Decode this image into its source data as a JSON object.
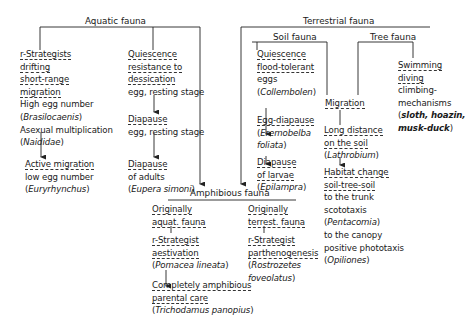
{
  "headers": {
    "aquatic": "Aquatic fauna",
    "terrestrial": "Terrestrial fauna",
    "soil": "Soil fauna",
    "tree": "Tree fauna",
    "amphibious": "Amphibious fauna"
  },
  "aquatic": {
    "r_strategists": {
      "line1": "r-Strategists",
      "line2": "drifting",
      "line3": "short-range",
      "line4": "migration",
      "line5": "High egg number",
      "line6_pre": "(",
      "line6_it": "Brasilocaenis",
      "line6_post": ")",
      "line7": "Asexual multiplication",
      "line8_pre": "(",
      "line8_it": "Naididae",
      "line8_post": ")"
    },
    "active_migration": {
      "line1": "Active migration",
      "line2": "low egg number",
      "line3_pre": "(",
      "line3_it": "Euryrhynchus",
      "line3_post": ")"
    },
    "quiescence": {
      "line1": "Quiescence",
      "line2": "resistance to",
      "line3": "dessication",
      "line4": "egg, resting stage"
    },
    "diapause_egg": {
      "line1": "Diapause",
      "line2": "egg, resting stage"
    },
    "diapause_adults": {
      "line1": "Diapause",
      "line2": "of adults",
      "line3_pre": "(",
      "line3_it": "Eupera simoni",
      "line3_post": ")"
    }
  },
  "soil": {
    "quiescence": {
      "line1": "Quiescence",
      "line2": "flood-tolerant",
      "line3": "eggs",
      "line4_pre": "(",
      "line4_it": "Collembolen",
      "line4_post": ")"
    },
    "egg_diapause": {
      "line1": "Egg-diapause",
      "line2_pre": "(",
      "line2_it": "Eremobelba",
      "line3_it": "foliata",
      "line3_post": ")"
    },
    "diapause_larvae": {
      "line1": "Diapause",
      "line2": "of larvae",
      "line3_pre": "(",
      "line3_it": "Epilampra",
      "line3_post": ")"
    }
  },
  "migration": {
    "label": "Migration",
    "long_distance": {
      "line1": "Long distance",
      "line2": "on the soil",
      "line3_pre": "(",
      "line3_it": "Lathrobium",
      "line3_post": ")"
    },
    "habitat_change": {
      "line1": "Habitat change",
      "line2": "soil-tree-soil",
      "line3": "to the trunk",
      "line4": "scototaxis",
      "line5_pre": "(",
      "line5_it": "Pentacomia",
      "line5_post": ")",
      "line6": "to the canopy",
      "line7": "positive phototaxis",
      "line8_pre": "(",
      "line8_it": "Opiliones",
      "line8_post": ")"
    }
  },
  "tree": {
    "swimming": {
      "line1": "Swimming",
      "line2": "diving",
      "line3": "climbing-",
      "line4": "mechanisms",
      "line5_pre": "(",
      "line5_it": "sloth, hoazin,",
      "line6_it": "musk-duck",
      "line6_post": ")"
    }
  },
  "amphibious": {
    "aquat": {
      "line1": "Originally",
      "line2": "aquat. fauna",
      "line3": "r-Strategist",
      "line4": "aestivation",
      "line5_pre": "(",
      "line5_it": "Pomacea lineata",
      "line5_post": ")",
      "line6": "Completely amphibious",
      "line7": "parental care",
      "line8_pre": "(",
      "line8_it": "Trichodamus panopius",
      "line8_post": ")"
    },
    "terrest": {
      "line1": "Originally",
      "line2": "terrest. fauna",
      "line3": "r-Strategist",
      "line4": "parthenogenesis",
      "line5_pre": "(",
      "line5_it": "Rostrozetes",
      "line6_it": "foveolatus",
      "line6_post": ")"
    }
  }
}
